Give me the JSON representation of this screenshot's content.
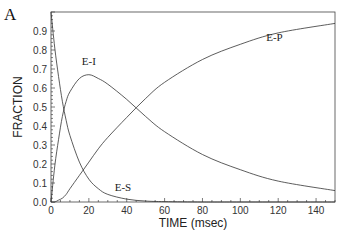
{
  "chart_data": {
    "type": "line",
    "panel_label": "A",
    "title": "",
    "xlabel": "TIME (msec)",
    "ylabel": "FRACTION",
    "xlim": [
      0,
      150
    ],
    "ylim": [
      0,
      1.0
    ],
    "x_ticks": [
      0,
      20,
      40,
      60,
      80,
      100,
      120,
      140
    ],
    "y_ticks": [
      "0.0",
      "0.1",
      "0.2",
      "0.3",
      "0.4",
      "0.5",
      "0.6",
      "0.7",
      "0.8",
      "0.9"
    ],
    "grid": false,
    "legend": "none",
    "series": [
      {
        "name": "E-S",
        "label": "E-S",
        "label_at": [
          38,
          0.06
        ],
        "x": [
          0,
          2,
          4,
          6,
          8,
          10,
          15,
          20,
          25,
          30,
          40,
          50,
          60,
          80,
          100,
          150
        ],
        "y": [
          1.0,
          0.81,
          0.66,
          0.53,
          0.43,
          0.35,
          0.21,
          0.12,
          0.07,
          0.04,
          0.015,
          0.005,
          0.002,
          0.0,
          0.0,
          0.0
        ]
      },
      {
        "name": "E-I",
        "label": "E-I",
        "label_at": [
          20,
          0.72
        ],
        "x": [
          0,
          2,
          4,
          6,
          8,
          10,
          15,
          20,
          25,
          30,
          40,
          50,
          60,
          80,
          100,
          120,
          150
        ],
        "y": [
          0.0,
          0.19,
          0.33,
          0.45,
          0.53,
          0.58,
          0.65,
          0.67,
          0.65,
          0.62,
          0.54,
          0.45,
          0.37,
          0.25,
          0.17,
          0.11,
          0.06
        ]
      },
      {
        "name": "E-P",
        "label": "E-P",
        "label_at": [
          118,
          0.85
        ],
        "x": [
          0,
          2,
          4,
          6,
          8,
          10,
          15,
          20,
          25,
          30,
          40,
          50,
          60,
          80,
          100,
          120,
          150
        ],
        "y": [
          0.0,
          0.0,
          0.01,
          0.02,
          0.04,
          0.07,
          0.14,
          0.21,
          0.28,
          0.34,
          0.445,
          0.545,
          0.63,
          0.75,
          0.83,
          0.89,
          0.94
        ]
      }
    ]
  }
}
